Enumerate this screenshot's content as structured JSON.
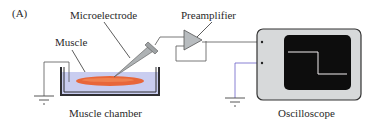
{
  "figure": {
    "panel_label": "(A)",
    "labels": {
      "microelectrode": "Microelectrode",
      "preamplifier": "Preamplifier",
      "muscle": "Muscle",
      "muscle_chamber": "Muscle chamber",
      "oscilloscope": "Oscilloscope"
    },
    "colors": {
      "muscle": "#e8663a",
      "bath": "#c9cdf0",
      "amplifier": "#b8bcbf",
      "scope_body": "#d7d9da",
      "scope_screen": "#0d0d0d",
      "trace": "#f2eef0",
      "ground_wire": "#6a5fc8"
    }
  }
}
